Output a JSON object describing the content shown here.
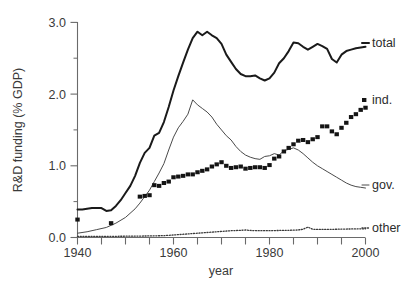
{
  "chart_data": {
    "type": "line",
    "title": "",
    "xlabel": "year",
    "ylabel": "R&D funding (% GDP)",
    "xlim": [
      1940,
      2000
    ],
    "ylim": [
      0.0,
      3.0
    ],
    "grid": false,
    "legend_position": "right-inline-labels",
    "x_ticks": [
      1940,
      1945,
      1950,
      1955,
      1960,
      1965,
      1970,
      1975,
      1980,
      1985,
      1990,
      1995,
      2000
    ],
    "x_tick_labels": [
      "1940",
      "",
      "",
      "",
      "1960",
      "",
      "",
      "",
      "1980",
      "",
      "",
      "",
      "2000"
    ],
    "y_ticks": [
      0.0,
      0.5,
      1.0,
      1.5,
      2.0,
      2.5,
      3.0
    ],
    "y_tick_labels": [
      "0.0",
      "",
      "1.0",
      "",
      "2.0",
      "",
      "3.0"
    ],
    "series": [
      {
        "name": "total",
        "label": "total",
        "style": "thick-solid-line",
        "color": "#1a1a1a",
        "x": [
          1940,
          1941,
          1942,
          1943,
          1944,
          1945,
          1946,
          1947,
          1948,
          1949,
          1950,
          1951,
          1952,
          1953,
          1954,
          1955,
          1956,
          1957,
          1958,
          1959,
          1960,
          1961,
          1962,
          1963,
          1964,
          1965,
          1966,
          1967,
          1968,
          1969,
          1970,
          1971,
          1972,
          1973,
          1974,
          1975,
          1976,
          1977,
          1978,
          1979,
          1980,
          1981,
          1982,
          1983,
          1984,
          1985,
          1986,
          1987,
          1988,
          1989,
          1990,
          1991,
          1992,
          1993,
          1994,
          1995,
          1996,
          1997,
          1998,
          1999,
          2000
        ],
        "y": [
          0.39,
          0.39,
          0.4,
          0.41,
          0.41,
          0.41,
          0.37,
          0.38,
          0.44,
          0.52,
          0.62,
          0.72,
          0.86,
          1.04,
          1.18,
          1.25,
          1.42,
          1.46,
          1.61,
          1.82,
          2.05,
          2.25,
          2.44,
          2.62,
          2.78,
          2.87,
          2.82,
          2.87,
          2.82,
          2.78,
          2.7,
          2.55,
          2.45,
          2.35,
          2.28,
          2.25,
          2.25,
          2.26,
          2.22,
          2.19,
          2.22,
          2.3,
          2.43,
          2.5,
          2.6,
          2.72,
          2.71,
          2.66,
          2.62,
          2.66,
          2.7,
          2.67,
          2.63,
          2.49,
          2.44,
          2.55,
          2.6,
          2.62,
          2.64,
          2.65,
          2.66
        ]
      },
      {
        "name": "gov",
        "label": "gov.",
        "style": "thin-solid-line",
        "color": "#4a4a4a",
        "x": [
          1940,
          1942,
          1944,
          1946,
          1948,
          1950,
          1952,
          1953,
          1954,
          1955,
          1956,
          1957,
          1958,
          1959,
          1960,
          1961,
          1962,
          1963,
          1964,
          1965,
          1966,
          1967,
          1968,
          1969,
          1970,
          1971,
          1972,
          1973,
          1974,
          1975,
          1976,
          1977,
          1978,
          1979,
          1980,
          1981,
          1982,
          1983,
          1984,
          1985,
          1986,
          1987,
          1988,
          1989,
          1990,
          1991,
          1992,
          1993,
          1994,
          1995,
          1996,
          1997,
          1998,
          1999,
          2000
        ],
        "y": [
          0.06,
          0.08,
          0.11,
          0.14,
          0.2,
          0.28,
          0.4,
          0.48,
          0.57,
          0.66,
          0.78,
          0.9,
          1.03,
          1.22,
          1.4,
          1.53,
          1.62,
          1.72,
          1.92,
          1.85,
          1.8,
          1.75,
          1.68,
          1.58,
          1.5,
          1.42,
          1.36,
          1.27,
          1.2,
          1.15,
          1.12,
          1.1,
          1.09,
          1.13,
          1.14,
          1.17,
          1.15,
          1.21,
          1.23,
          1.25,
          1.22,
          1.17,
          1.11,
          1.05,
          1.0,
          0.96,
          0.92,
          0.88,
          0.84,
          0.8,
          0.76,
          0.73,
          0.71,
          0.7,
          0.69
        ]
      },
      {
        "name": "ind",
        "label": "ind.",
        "style": "filled-square-markers",
        "color": "#141414",
        "x": [
          1940,
          1947,
          1953,
          1954,
          1955,
          1956,
          1957,
          1958,
          1959,
          1960,
          1961,
          1962,
          1963,
          1964,
          1965,
          1966,
          1967,
          1968,
          1969,
          1970,
          1971,
          1972,
          1973,
          1974,
          1975,
          1976,
          1977,
          1978,
          1979,
          1980,
          1981,
          1982,
          1983,
          1984,
          1985,
          1986,
          1987,
          1988,
          1989,
          1990,
          1991,
          1992,
          1993,
          1994,
          1995,
          1996,
          1997,
          1998,
          1999,
          2000
        ],
        "y": [
          0.25,
          0.2,
          0.57,
          0.58,
          0.59,
          0.73,
          0.72,
          0.76,
          0.78,
          0.84,
          0.85,
          0.86,
          0.88,
          0.88,
          0.91,
          0.93,
          0.95,
          0.99,
          1.02,
          1.05,
          1.0,
          0.97,
          0.98,
          0.99,
          0.96,
          0.97,
          0.98,
          0.98,
          0.97,
          1.01,
          1.1,
          1.13,
          1.2,
          1.25,
          1.3,
          1.35,
          1.36,
          1.33,
          1.37,
          1.4,
          1.55,
          1.55,
          1.48,
          1.44,
          1.53,
          1.6,
          1.68,
          1.72,
          1.78,
          1.81
        ]
      },
      {
        "name": "other",
        "label": "other",
        "style": "dotted-line",
        "color": "#3a3a3a",
        "x": [
          1940,
          1945,
          1950,
          1953,
          1956,
          1958,
          1960,
          1962,
          1964,
          1966,
          1968,
          1970,
          1972,
          1974,
          1975,
          1976,
          1978,
          1980,
          1982,
          1984,
          1986,
          1987,
          1988,
          1989,
          1990,
          1992,
          1994,
          1996,
          1998,
          2000
        ],
        "y": [
          0.015,
          0.015,
          0.018,
          0.02,
          0.023,
          0.026,
          0.035,
          0.045,
          0.055,
          0.065,
          0.075,
          0.085,
          0.095,
          0.1,
          0.105,
          0.098,
          0.095,
          0.095,
          0.098,
          0.1,
          0.105,
          0.115,
          0.145,
          0.115,
          0.112,
          0.113,
          0.115,
          0.118,
          0.12,
          0.122
        ]
      }
    ]
  },
  "labels": {
    "total": "total",
    "ind": "ind.",
    "gov": "gov.",
    "other": "other"
  },
  "axis": {
    "y_title": "R&D funding (% GDP)",
    "x_title": "year",
    "y_0": "0.0",
    "y_1": "1.0",
    "y_2": "2.0",
    "y_3": "3.0",
    "x_1940": "1940",
    "x_1960": "1960",
    "x_1980": "1980",
    "x_2000": "2000"
  }
}
